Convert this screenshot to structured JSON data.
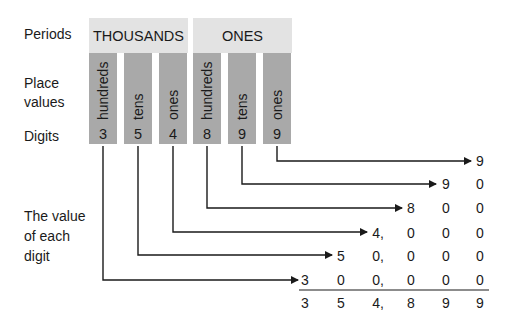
{
  "labels": {
    "periods": "Periods",
    "place_values_line1": "Place",
    "place_values_line2": "values",
    "digits": "Digits",
    "value_line1": "The value",
    "value_line2": "of each",
    "value_line3": "digit"
  },
  "periods": [
    {
      "name": "THOUSANDS"
    },
    {
      "name": "ONES"
    }
  ],
  "columns": [
    {
      "place": "hundreds",
      "digit": "3"
    },
    {
      "place": "tens",
      "digit": "5"
    },
    {
      "place": "ones",
      "digit": "4"
    },
    {
      "place": "hundreds",
      "digit": "8"
    },
    {
      "place": "tens",
      "digit": "9"
    },
    {
      "place": "ones",
      "digit": "9"
    }
  ],
  "expansion": {
    "rows": [
      [
        "",
        "",
        "",
        "",
        "",
        "9"
      ],
      [
        "",
        "",
        "",
        "",
        "9",
        "0"
      ],
      [
        "",
        "",
        "",
        "8",
        "0",
        "0"
      ],
      [
        "",
        "",
        "4,",
        "0",
        "0",
        "0"
      ],
      [
        "",
        "5",
        "0,",
        "0",
        "0",
        "0"
      ],
      [
        "3",
        "0",
        "0,",
        "0",
        "0",
        "0"
      ]
    ],
    "sum": [
      "3",
      "5",
      "4,",
      "8",
      "9",
      "9"
    ]
  },
  "colors": {
    "period_bg": "#e3e3e3",
    "column_bg": "#a9a9a9",
    "line": "#1a1a1a"
  }
}
